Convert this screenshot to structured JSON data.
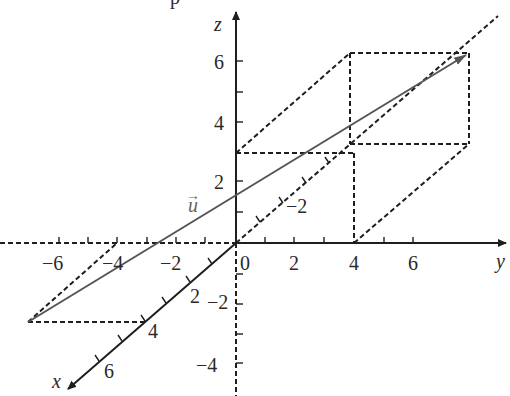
{
  "figure": {
    "title_fragment": "p",
    "axes": {
      "x": {
        "label": "x",
        "ticks": [
          "2",
          "4",
          "6"
        ]
      },
      "y": {
        "label": "y",
        "ticks": [
          "−6",
          "−4",
          "−2",
          "0",
          "2",
          "4",
          "6"
        ]
      },
      "z": {
        "label": "z",
        "ticks": [
          "6",
          "4",
          "2",
          "−2",
          "−4"
        ]
      },
      "x_negative_tick": "−2"
    },
    "vector": {
      "label": "u⃗",
      "name": "u",
      "arrow": "→"
    },
    "colors": {
      "axis": "#1e1e1e",
      "vector": "#555555",
      "background": "#ffffff"
    }
  }
}
